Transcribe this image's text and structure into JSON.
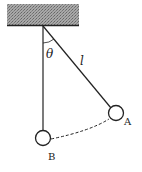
{
  "diagram": {
    "angle_label": "θ",
    "length_label": "l",
    "point_a_label": "A",
    "point_b_label": "B",
    "colors": {
      "ink": "#222222",
      "ceiling": "#9a9a9a"
    }
  }
}
